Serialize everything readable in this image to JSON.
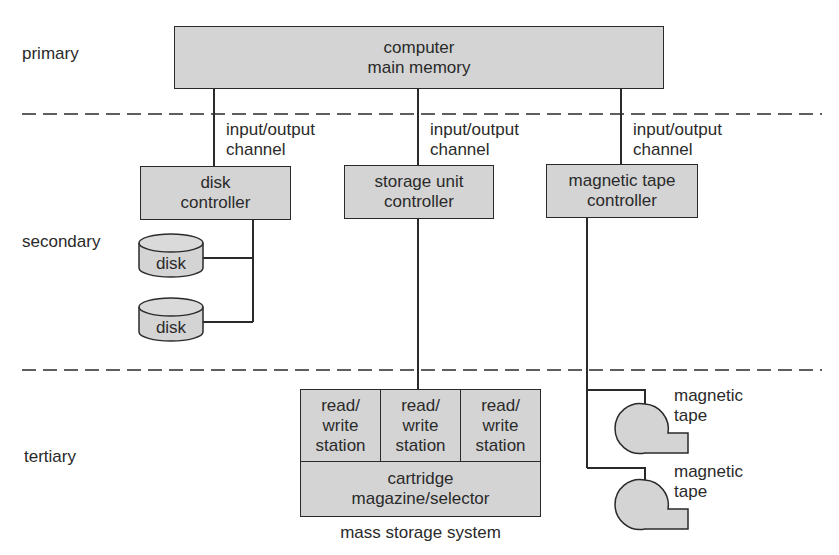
{
  "tiers": {
    "primary": "primary",
    "secondary": "secondary",
    "tertiary": "tertiary"
  },
  "nodes": {
    "main_memory": "computer\nmain memory",
    "disk_controller": "disk\ncontroller",
    "storage_unit_controller": "storage unit\ncontroller",
    "tape_controller": "magnetic tape\ncontroller",
    "disk_1": "disk",
    "disk_2": "disk",
    "rw_station_1": "read/\nwrite\nstation",
    "rw_station_2": "read/\nwrite\nstation",
    "rw_station_3": "read/\nwrite\nstation",
    "cartridge_magazine": "cartridge\nmagazine/selector",
    "tape_1": "magnetic\ntape",
    "tape_2": "magnetic\ntape"
  },
  "channels": {
    "left": "input/output\nchannel",
    "middle": "input/output\nchannel",
    "right": "input/output\nchannel"
  },
  "captions": {
    "mass_storage": "mass storage system"
  },
  "colors": {
    "fill": "#d4d4d4",
    "stroke": "#2a2a2a"
  }
}
